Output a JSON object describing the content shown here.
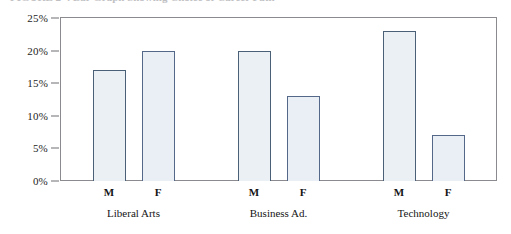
{
  "caption": {
    "text": "FIGURE 2-4  Bar Graph Showing Choice of Career Path",
    "visible": "partially-cropped"
  },
  "chart_data": {
    "type": "bar",
    "title": "",
    "xlabel": "",
    "ylabel": "",
    "ylim": [
      0,
      25
    ],
    "y_ticks": [
      0,
      5,
      10,
      15,
      20,
      25
    ],
    "y_tick_labels": [
      "0%",
      "5%",
      "10%",
      "15%",
      "20%",
      "25%"
    ],
    "grid": false,
    "legend": "none",
    "groups": [
      "Liberal Arts",
      "Business Ad.",
      "Technology"
    ],
    "categories": [
      "M",
      "F",
      "M",
      "F",
      "M",
      "F"
    ],
    "values": [
      17,
      20,
      20,
      13,
      23,
      7
    ],
    "bars": [
      {
        "group": "Liberal Arts",
        "gender": "M",
        "value": 17,
        "label": "17%"
      },
      {
        "group": "Liberal Arts",
        "gender": "F",
        "value": 20,
        "label": "20%"
      },
      {
        "group": "Business Ad.",
        "gender": "M",
        "value": 20,
        "label": "20%"
      },
      {
        "group": "Business Ad.",
        "gender": "F",
        "value": 13,
        "label": "13%"
      },
      {
        "group": "Technology",
        "gender": "M",
        "value": 23,
        "label": "23%"
      },
      {
        "group": "Technology",
        "gender": "F",
        "value": 7,
        "label": "7%"
      }
    ],
    "colors": {
      "bar_fill": "#eaf0f4",
      "bar_border": "#4a6077",
      "frame": "#8a8a8f",
      "text": "#141414"
    }
  }
}
